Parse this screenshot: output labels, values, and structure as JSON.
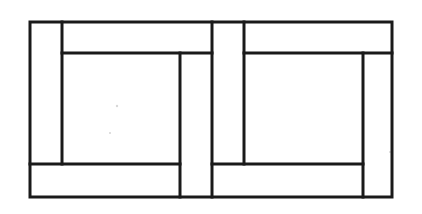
{
  "diagram": {
    "type": "line-drawing",
    "style": {
      "line_color": "#1a1a1a",
      "background_color": "#ffffff",
      "fill_color": "#ffffff",
      "outer_stroke_width": 3,
      "inner_stroke_width": 3
    },
    "canvas": {
      "width": 422,
      "height": 214
    },
    "outer_frame": {
      "label": "outer-frame",
      "x1": 30,
      "y1": 22,
      "x2": 392,
      "y2": 197,
      "width": 362,
      "height": 175
    },
    "vertical_lines": [
      {
        "label": "left-stile-inner-edge",
        "x": 62,
        "y1": 22,
        "y2": 164
      },
      {
        "label": "left-panel-right-edge",
        "x": 180,
        "y1": 53,
        "y2": 197
      },
      {
        "label": "center-mullion-left-edge",
        "x": 212,
        "y1": 22,
        "y2": 197
      },
      {
        "label": "center-mullion-right-edge",
        "x": 244,
        "y1": 22,
        "y2": 164
      },
      {
        "label": "right-panel-right-edge",
        "x": 363,
        "y1": 53,
        "y2": 197
      }
    ],
    "horizontal_lines": [
      {
        "label": "left-head-rail-bottom",
        "y": 53,
        "x1": 62,
        "x2": 212
      },
      {
        "label": "right-head-rail-bottom",
        "y": 53,
        "x1": 244,
        "x2": 392
      },
      {
        "label": "left-sill-rail-top",
        "y": 164,
        "x1": 30,
        "x2": 180
      },
      {
        "label": "right-sill-rail-top",
        "y": 164,
        "x1": 212,
        "x2": 363
      }
    ],
    "regions": [
      {
        "label": "left-vertical-stile",
        "x": 30,
        "y": 22,
        "width": 32,
        "height": 142
      },
      {
        "label": "left-head-rail",
        "x": 62,
        "y": 22,
        "width": 150,
        "height": 31
      },
      {
        "label": "left-center-panel",
        "x": 62,
        "y": 53,
        "width": 118,
        "height": 111
      },
      {
        "label": "left-right-stile",
        "x": 180,
        "y": 53,
        "width": 32,
        "height": 144
      },
      {
        "label": "left-sill-rail",
        "x": 30,
        "y": 164,
        "width": 150,
        "height": 33
      },
      {
        "label": "center-mullion",
        "x": 212,
        "y": 22,
        "width": 32,
        "height": 175
      },
      {
        "label": "right-head-rail",
        "x": 244,
        "y": 22,
        "width": 148,
        "height": 31
      },
      {
        "label": "right-center-panel",
        "x": 244,
        "y": 53,
        "width": 119,
        "height": 111
      },
      {
        "label": "right-end-stile",
        "x": 363,
        "y": 53,
        "width": 29,
        "height": 144
      },
      {
        "label": "right-sill-rail",
        "x": 212,
        "y": 164,
        "width": 151,
        "height": 33
      }
    ],
    "specks": [
      {
        "label": "paper-speck-upper",
        "cx": 117,
        "cy": 106,
        "r": 1.2
      },
      {
        "label": "paper-speck-lower",
        "cx": 110,
        "cy": 133,
        "r": 1.1
      },
      {
        "label": "paper-speck-right-edge",
        "cx": 390,
        "cy": 152,
        "r": 1.0
      }
    ]
  }
}
